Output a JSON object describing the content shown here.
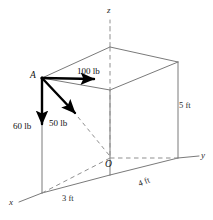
{
  "figure": {
    "background_color": "#ffffff",
    "stroke_color": "#6b6b6b",
    "force_color": "#000000",
    "dash_color": "#8a8a8a"
  },
  "axes": [
    {
      "name": "z-axis",
      "label": "z",
      "direction": "up",
      "style": "dashed"
    },
    {
      "name": "y-axis",
      "label": "y",
      "direction": "right",
      "style": "solid"
    },
    {
      "name": "x-axis",
      "label": "x",
      "direction": "lower-left",
      "style": "solid"
    }
  ],
  "points": [
    {
      "name": "origin",
      "label": "O"
    },
    {
      "name": "corner-a",
      "label": "A"
    }
  ],
  "dimensions": [
    {
      "name": "depth-x",
      "label": "3 ft",
      "value": 3,
      "unit": "ft",
      "edge": "x-direction"
    },
    {
      "name": "width-y",
      "label": "4 ft",
      "value": 4,
      "unit": "ft",
      "edge": "y-direction"
    },
    {
      "name": "height-z",
      "label": "5 ft",
      "value": 5,
      "unit": "ft",
      "edge": "z-direction"
    }
  ],
  "forces": [
    {
      "name": "force-100lb",
      "label": "100 lb",
      "magnitude": 100,
      "unit": "lb",
      "direction": "horizontal-right (+y)",
      "applied_at": "A"
    },
    {
      "name": "force-60lb",
      "label": "60 lb",
      "magnitude": 60,
      "unit": "lb",
      "direction": "vertical-down (-z)",
      "applied_at": "A"
    },
    {
      "name": "force-50lb",
      "label": "50 lb",
      "magnitude": 50,
      "unit": "lb",
      "direction": "diagonal down-right toward O",
      "applied_at": "A"
    }
  ]
}
